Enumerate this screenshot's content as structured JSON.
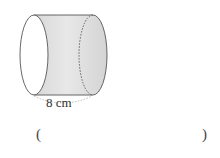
{
  "figure": {
    "shape": "cylinder",
    "orientation": "horizontal",
    "dimension_label": "8 cm",
    "dimension_meaning": "length of cylinder",
    "colors": {
      "face": "#ffffff",
      "body": "#e4e4e4",
      "stroke": "#555555",
      "measure_arc": "#aaaaaa"
    }
  },
  "answer": {
    "open_paren": "(",
    "close_paren": ")",
    "value": ""
  }
}
